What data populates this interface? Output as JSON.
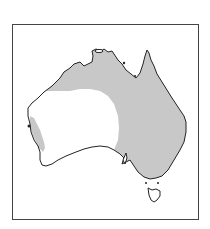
{
  "map": {
    "region": "Australia",
    "type": "species distribution map",
    "colors": {
      "land": "#ffffff",
      "distribution": "#c8c8c8",
      "coastline": "#222222",
      "frame": "#444444"
    },
    "legend": []
  }
}
